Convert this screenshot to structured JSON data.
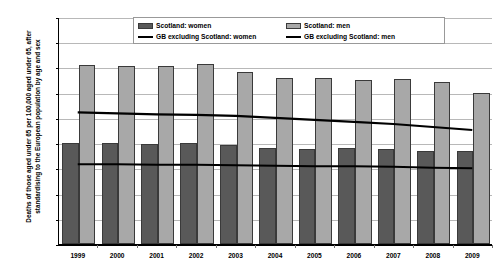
{
  "chart_data": {
    "type": "bar",
    "title": "",
    "xlabel": "",
    "ylabel": "Deaths of those aged under 65 per 100,000 aged under 65, after standardising to the European population by age and sex",
    "ylim": [
      0,
      450
    ],
    "yticks": [
      0,
      50,
      100,
      150,
      200,
      250,
      300,
      350,
      400,
      450
    ],
    "grid": true,
    "legend_position": "top-center",
    "categories": [
      "1999",
      "2000",
      "2001",
      "2002",
      "2003",
      "2004",
      "2005",
      "2006",
      "2007",
      "2008",
      "2009"
    ],
    "series": [
      {
        "name": "Scotland: women",
        "kind": "bar",
        "color": "#595959",
        "values": [
          201,
          200,
          199,
          200,
          197,
          190,
          188,
          190,
          189,
          184,
          184
        ]
      },
      {
        "name": "Scotland: men",
        "kind": "bar",
        "color": "#a8a8a8",
        "values": [
          355,
          353,
          352,
          356,
          341,
          329,
          330,
          326,
          327,
          322,
          300
        ]
      },
      {
        "name": "GB excluding Scotland: women",
        "kind": "line",
        "color": "#000000",
        "values": [
          160,
          160,
          159,
          159,
          158,
          157,
          156,
          156,
          155,
          153,
          152
        ]
      },
      {
        "name": "GB excluding Scotland: men",
        "kind": "line",
        "color": "#000000",
        "values": [
          263,
          261,
          259,
          258,
          256,
          252,
          248,
          244,
          240,
          234,
          228
        ]
      }
    ]
  },
  "legend": {
    "entries": [
      {
        "label": "Scotland: women",
        "marker": "bar-swatch-dark"
      },
      {
        "label": "Scotland: men",
        "marker": "bar-swatch-light"
      },
      {
        "label": "GB excluding Scotland: women",
        "marker": "line-swatch"
      },
      {
        "label": "GB excluding Scotland: men",
        "marker": "line-swatch"
      }
    ]
  },
  "colors": {
    "women_bar": "#595959",
    "men_bar": "#a8a8a8",
    "line": "#000000",
    "gridline": "#b8b8b8",
    "axis": "#000000",
    "background": "#ffffff"
  }
}
